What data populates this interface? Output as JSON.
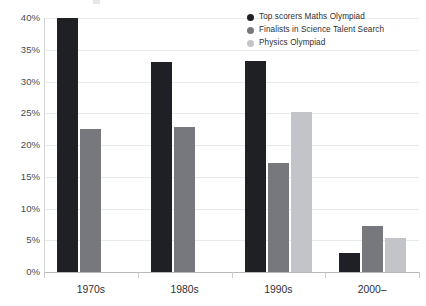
{
  "chart_data": {
    "type": "bar",
    "title": "",
    "xlabel": "",
    "ylabel": "",
    "categories": [
      "1970s",
      "1980s",
      "1990s",
      "2000–"
    ],
    "series": [
      {
        "name": "Top scorers Maths Olympiad",
        "color": "#1f2025",
        "values": [
          40.0,
          33.0,
          33.2,
          3.0
        ]
      },
      {
        "name": "Finalists in Science Talent Search",
        "color": "#76787e",
        "values": [
          22.5,
          22.8,
          17.1,
          7.2
        ]
      },
      {
        "name": "Physics Olympiad",
        "color": "#c3c4c9",
        "values": [
          null,
          null,
          25.2,
          5.4
        ]
      }
    ],
    "ylim": [
      0,
      40
    ],
    "ytick_values": [
      0,
      5,
      10,
      15,
      20,
      25,
      30,
      35,
      40
    ],
    "ytick_labels": [
      "0%",
      "5%",
      "10%",
      "15%",
      "20%",
      "25%",
      "30%",
      "35%",
      "40%"
    ],
    "grid": true,
    "legend_position": "top-right"
  },
  "legend": {
    "items": [
      {
        "label": "Top scorers Maths Olympiad",
        "color": "#1f2025"
      },
      {
        "label": "Finalists in Science Talent Search",
        "color": "#76787e"
      },
      {
        "label": "Physics Olympiad",
        "color": "#c3c4c9"
      }
    ]
  },
  "colors": {
    "series_dark": "#1f2025",
    "series_mid": "#76787e",
    "series_light": "#c3c4c9",
    "gridline": "#e9eaec",
    "axis": "#b9babd",
    "text": "#2f3034",
    "background": "#ffffff"
  }
}
